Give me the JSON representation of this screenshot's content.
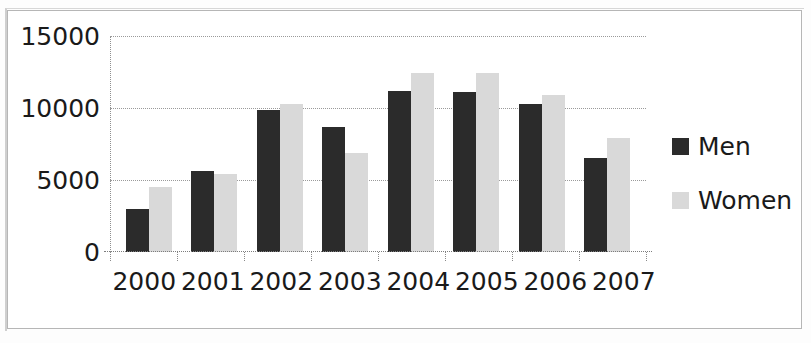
{
  "chart_data": {
    "type": "bar",
    "title": "",
    "subtitle": "",
    "xlabel": "",
    "ylabel": "",
    "categories": [
      "2000",
      "2001",
      "2002",
      "2003",
      "2004",
      "2005",
      "2006",
      "2007"
    ],
    "series": [
      {
        "name": "Men",
        "color": "#2b2b2b",
        "values": [
          3000,
          5600,
          9850,
          8700,
          11200,
          11100,
          10250,
          6500
        ]
      },
      {
        "name": "Women",
        "color": "#d9d9d9",
        "values": [
          4500,
          5400,
          10250,
          6900,
          12400,
          12450,
          10900,
          7900
        ]
      }
    ],
    "ylim": [
      0,
      15000
    ],
    "yticks": [
      0,
      5000,
      10000,
      15000
    ],
    "ytick_labels": [
      "0",
      "5000",
      "10000",
      "15000"
    ],
    "grid": true,
    "legend_position": "right"
  },
  "legend": {
    "items": [
      {
        "label": "Men",
        "color": "#2b2b2b"
      },
      {
        "label": "Women",
        "color": "#d9d9d9"
      }
    ]
  },
  "axis": {
    "y_tick_labels": [
      "15000",
      "10000",
      "5000",
      "0"
    ],
    "x_tick_labels": [
      "2000",
      "2001",
      "2002",
      "2003",
      "2004",
      "2005",
      "2006",
      "2007"
    ]
  },
  "colors": {
    "men_bar": "#2b2b2b",
    "women_bar": "#d9d9d9",
    "gridline": "#9a9a9a",
    "text": "#1a1a1a",
    "border": "#b6b6b6",
    "background": "#ffffff"
  }
}
